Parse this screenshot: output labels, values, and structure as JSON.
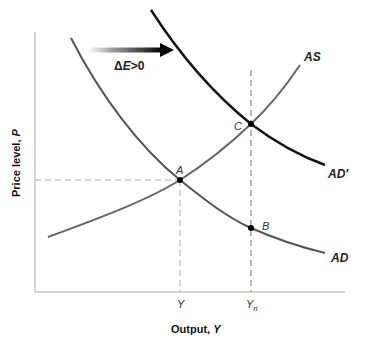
{
  "diagram": {
    "type": "AD-AS model",
    "axes": {
      "x_title": "Output, ",
      "x_var": "Y",
      "y_title": "Price level, ",
      "y_var": "P",
      "x_ticks": [
        {
          "label": "Y",
          "sub": ""
        },
        {
          "label": "Y",
          "sub": "n"
        }
      ]
    },
    "curves": [
      {
        "id": "AD",
        "label": "AD",
        "color": "#555555"
      },
      {
        "id": "AD_prime",
        "label": "AD′",
        "color": "#111111"
      },
      {
        "id": "AS",
        "label": "AS",
        "color": "#666666"
      }
    ],
    "points": [
      {
        "id": "A",
        "label": "A"
      },
      {
        "id": "B",
        "label": "B"
      },
      {
        "id": "C",
        "label": "C"
      }
    ],
    "shift_arrow": {
      "label_delta": "Δ",
      "label_var": "E",
      "label_rest": ">0"
    },
    "colors": {
      "axis": "#c8c8c8",
      "dashed": "#a8a8a8",
      "ad": "#555555",
      "ad_prime": "#111111",
      "as": "#666666"
    }
  }
}
